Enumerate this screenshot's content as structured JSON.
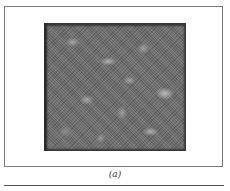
{
  "figure": {
    "panel_label": "(a)",
    "image_description": "grayscale mottled texture micrograph"
  }
}
